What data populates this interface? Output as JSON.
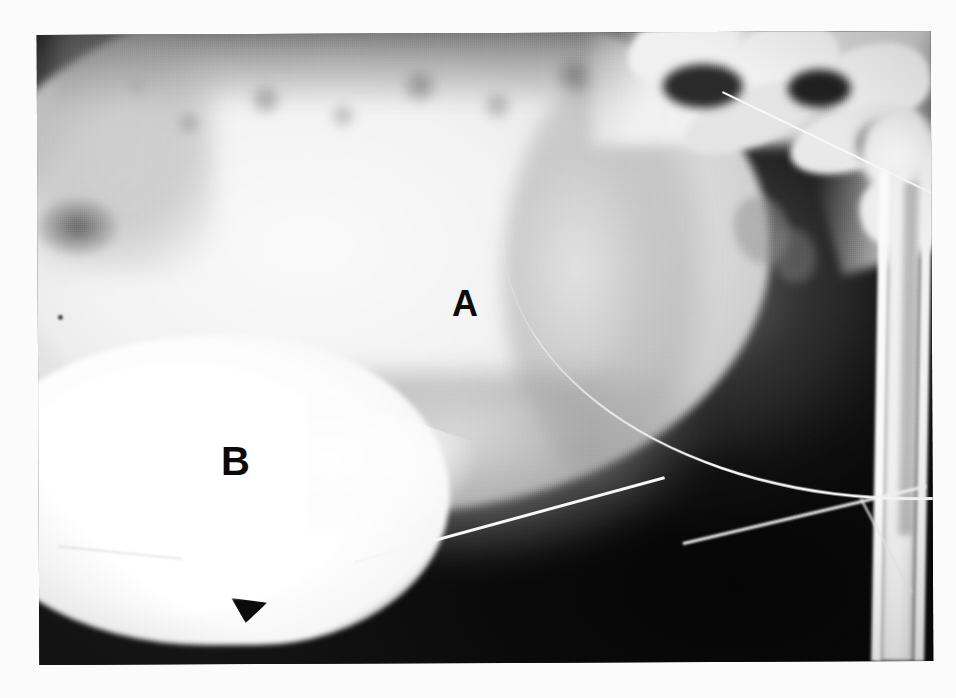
{
  "figure": {
    "kind": "radiograph",
    "modality": "plain-film-radiograph",
    "view": "lateral pelvis / cystogram",
    "background_color": "#fbfbfb",
    "panel": {
      "left": 38,
      "top": 33,
      "width": 894,
      "height": 630,
      "border_color": "#0d0d0d"
    }
  },
  "annotations": [
    {
      "id": "label-a",
      "text": "A",
      "color": "#0a0a0a",
      "x": 452,
      "y": 286,
      "font_size": 36,
      "describes": "large rounded radiopaque soft-tissue mass occupying the upper pelvis"
    },
    {
      "id": "label-b",
      "text": "B",
      "color": "#0a0a0a",
      "x": 221,
      "y": 441,
      "font_size": 40,
      "describes": "bright contrast-filled teardrop structure in the lower left field"
    }
  ],
  "structures": {
    "mass_a": {
      "name": "soft-tissue mass",
      "tone": "bright-gray",
      "shape": "rounded ovoid"
    },
    "structure_b": {
      "name": "contrast-filled viscus",
      "tone": "white",
      "shape": "teardrop pointing right"
    },
    "bone_upper_right": {
      "name": "sacrum and lumbar vertebrae",
      "tone": "white"
    },
    "bone_right_edge": {
      "name": "femur",
      "tone": "white"
    },
    "catheter": {
      "name": "radiopaque catheter tube",
      "tone": "white",
      "count": 2
    },
    "dark_field": {
      "name": "air / unexposed background",
      "tone": "black"
    }
  }
}
